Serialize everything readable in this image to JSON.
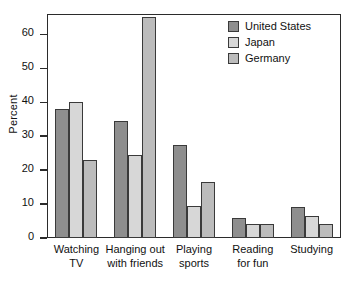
{
  "chart_data": {
    "type": "bar",
    "title": "",
    "xlabel": "",
    "ylabel": "Percent",
    "ylim": [
      0,
      66
    ],
    "yticks": [
      0,
      10,
      20,
      30,
      40,
      50,
      60
    ],
    "grid": false,
    "legend_position": "top-right",
    "categories": [
      "Watching TV",
      "Hanging out with friends",
      "Playing sports",
      "Reading for fun",
      "Studying"
    ],
    "category_lines": [
      [
        "Watching",
        "TV"
      ],
      [
        "Hanging out",
        "with friends"
      ],
      [
        "Playing",
        "sports"
      ],
      [
        "Reading",
        "for fun"
      ],
      [
        "Studying"
      ]
    ],
    "series": [
      {
        "name": "United States",
        "color": "#8e8e8e",
        "values": [
          38,
          34.5,
          27.5,
          6,
          9
        ]
      },
      {
        "name": "Japan",
        "color": "#d7d7d7",
        "values": [
          40,
          24.5,
          9.5,
          4,
          6.5
        ]
      },
      {
        "name": "Germany",
        "color": "#bcbcbc",
        "values": [
          23,
          65,
          16.5,
          4,
          4
        ]
      }
    ]
  }
}
